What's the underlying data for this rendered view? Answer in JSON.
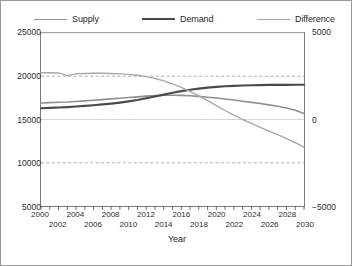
{
  "legend": {
    "items": [
      {
        "label": "Supply",
        "color": "#8f8f8f",
        "width": 1.6
      },
      {
        "label": "Demand",
        "color": "#4a4a4a",
        "width": 2.2
      },
      {
        "label": "Difference",
        "color": "#a8a8a8",
        "width": 1.4
      }
    ]
  },
  "axes": {
    "x_title": "Year",
    "y_left_ticks": [
      "25000",
      "20000",
      "15000",
      "10000",
      "5000"
    ],
    "y_right_ticks": [
      "5000",
      "0",
      "-5000"
    ],
    "x_ticks": [
      "2000",
      "2002",
      "2004",
      "2006",
      "2008",
      "2010",
      "2012",
      "2014",
      "2016",
      "2018",
      "2020",
      "2022",
      "2024",
      "2026",
      "2028",
      "2030"
    ]
  },
  "chart_data": {
    "type": "line",
    "title": "",
    "xlabel": "Year",
    "ylabel": "",
    "grid": true,
    "legend_position": "top",
    "xlim": [
      2000,
      2030
    ],
    "ylim": [
      5000,
      25000
    ],
    "y2lim": [
      -5000,
      5000
    ],
    "y_ticks": [
      5000,
      10000,
      15000,
      20000,
      25000
    ],
    "y2_ticks": [
      -5000,
      0,
      5000
    ],
    "x": [
      2000,
      2001,
      2002,
      2003,
      2004,
      2005,
      2006,
      2007,
      2008,
      2009,
      2010,
      2011,
      2012,
      2013,
      2014,
      2015,
      2016,
      2017,
      2018,
      2019,
      2020,
      2021,
      2022,
      2023,
      2024,
      2025,
      2026,
      2027,
      2028,
      2029,
      2030
    ],
    "series": [
      {
        "name": "Supply",
        "axis": "left",
        "color": "#8f8f8f",
        "values": [
          16900,
          16950,
          17000,
          17020,
          17080,
          17150,
          17220,
          17300,
          17380,
          17460,
          17540,
          17620,
          17700,
          17760,
          17800,
          17810,
          17790,
          17740,
          17670,
          17580,
          17480,
          17370,
          17250,
          17120,
          16980,
          16840,
          16690,
          16530,
          16330,
          16060,
          15700
        ]
      },
      {
        "name": "Demand",
        "axis": "left",
        "color": "#4a4a4a",
        "values": [
          16300,
          16340,
          16390,
          16440,
          16500,
          16570,
          16650,
          16740,
          16840,
          16960,
          17100,
          17260,
          17450,
          17660,
          17880,
          18090,
          18280,
          18440,
          18570,
          18680,
          18770,
          18840,
          18890,
          18930,
          18960,
          18980,
          18995,
          19005,
          19010,
          19015,
          19020
        ]
      },
      {
        "name": "Difference",
        "axis": "right",
        "color": "#a8a8a8",
        "values": [
          2700,
          2700,
          2690,
          2540,
          2640,
          2660,
          2670,
          2670,
          2660,
          2640,
          2610,
          2560,
          2480,
          2370,
          2230,
          2060,
          1860,
          1630,
          1370,
          1090,
          800,
          520,
          250,
          0,
          -230,
          -450,
          -670,
          -880,
          -1100,
          -1340,
          -1600
        ]
      }
    ]
  }
}
